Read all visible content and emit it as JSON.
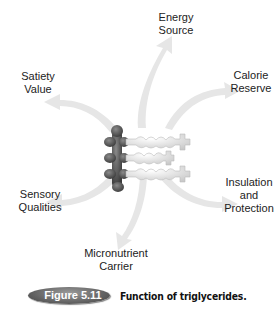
{
  "diagram": {
    "center": "Triglyceride molecule (glycerol backbone with three fatty acid chains)",
    "functions": [
      {
        "id": "energy",
        "lines": [
          "Energy",
          "Source"
        ]
      },
      {
        "id": "calorie",
        "lines": [
          "Calorie",
          "Reserve"
        ]
      },
      {
        "id": "insulation",
        "lines": [
          "Insulation",
          "and",
          "Protection"
        ]
      },
      {
        "id": "micronutrient",
        "lines": [
          "Micronutrient",
          "Carrier"
        ]
      },
      {
        "id": "sensory",
        "lines": [
          "Sensory",
          "Qualities"
        ]
      },
      {
        "id": "satiety",
        "lines": [
          "Satiety",
          "Value"
        ]
      }
    ]
  },
  "caption": {
    "figure_label": "Figure 5.11",
    "text": "Function of triglycerides."
  }
}
